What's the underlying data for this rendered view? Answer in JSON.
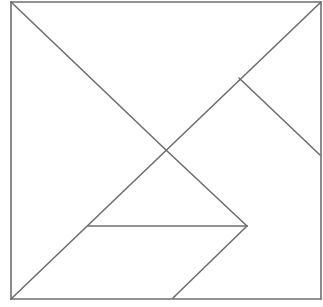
{
  "diagram": {
    "type": "tangram",
    "canvas": {
      "width": 323,
      "height": 307
    },
    "colors": {
      "stroke": "#6e6e6e",
      "fill": "#ffffff",
      "background": "#ffffff"
    },
    "outer_square": {
      "x": 11,
      "y": 2,
      "width": 310,
      "height": 297
    },
    "pieces": [
      {
        "name": "large-triangle-left",
        "points": "11,2 166,150 11,299"
      },
      {
        "name": "large-triangle-top",
        "points": "11,2 321,2 166,150"
      },
      {
        "name": "square",
        "points": "166,150 239,78 320,155 247,226"
      },
      {
        "name": "small-triangle-top-right",
        "points": "239,78 321,2 320,155"
      },
      {
        "name": "small-triangle-middle",
        "points": "88,226 166,150 247,226"
      },
      {
        "name": "parallelogram",
        "points": "11,299 88,226 247,226 173,298"
      },
      {
        "name": "medium-triangle-bottom-right",
        "points": "247,226 320,155 321,299 173,298"
      }
    ],
    "lines": [
      {
        "name": "outer-top",
        "x1": 11,
        "y1": 2,
        "x2": 321,
        "y2": 2
      },
      {
        "name": "outer-right",
        "x1": 321,
        "y1": 2,
        "x2": 321,
        "y2": 299
      },
      {
        "name": "outer-bottom",
        "x1": 11,
        "y1": 299,
        "x2": 321,
        "y2": 299
      },
      {
        "name": "outer-left",
        "x1": 11,
        "y1": 2,
        "x2": 11,
        "y2": 299
      },
      {
        "name": "diagonal-top-left-to-centre",
        "x1": 11,
        "y1": 2,
        "x2": 166,
        "y2": 150
      },
      {
        "name": "diagonal-bottom-left-to-top-right",
        "x1": 11,
        "y1": 299,
        "x2": 321,
        "y2": 2
      },
      {
        "name": "square-right-edge",
        "x1": 239,
        "y1": 78,
        "x2": 320,
        "y2": 155
      },
      {
        "name": "centre-to-lower-junction",
        "x1": 166,
        "y1": 150,
        "x2": 247,
        "y2": 226
      },
      {
        "name": "horizontal-mid",
        "x1": 88,
        "y1": 226,
        "x2": 247,
        "y2": 226
      },
      {
        "name": "parallelogram-right-edge",
        "x1": 247,
        "y1": 226,
        "x2": 173,
        "y2": 298
      }
    ]
  }
}
